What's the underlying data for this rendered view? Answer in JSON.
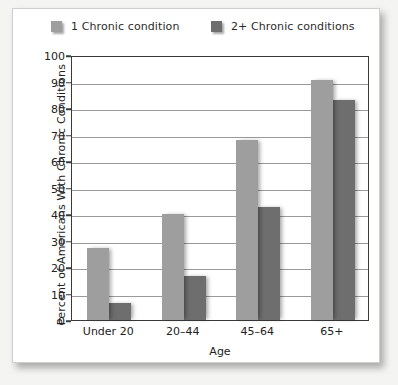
{
  "chart_data": {
    "type": "bar",
    "title": "",
    "xlabel": "Age",
    "ylabel": "Percent of Americans With Chronic Conditions",
    "categories": [
      "Under 20",
      "20–44",
      "45–64",
      "65+"
    ],
    "series": [
      {
        "name": "1 Chronic condition",
        "color": "#9e9e9e",
        "values": [
          27,
          40,
          68,
          90.5
        ]
      },
      {
        "name": "2+ Chronic conditions",
        "color": "#6e6e6e",
        "values": [
          6.5,
          16.5,
          42.5,
          83
        ]
      }
    ],
    "ylim": [
      0,
      100
    ],
    "yticks": [
      0,
      10,
      20,
      30,
      40,
      50,
      60,
      70,
      80,
      90,
      100
    ],
    "ytick_labels": [
      "0",
      "10",
      "20",
      "30",
      "40",
      "50",
      "60",
      "70",
      "80",
      "90",
      "100"
    ],
    "grid": "horizontal",
    "legend_position": "top"
  },
  "legend": {
    "entries": [
      {
        "label": "1 Chronic condition",
        "color": "#9e9e9e"
      },
      {
        "label": "2+ Chronic conditions",
        "color": "#6e6e6e"
      }
    ]
  }
}
